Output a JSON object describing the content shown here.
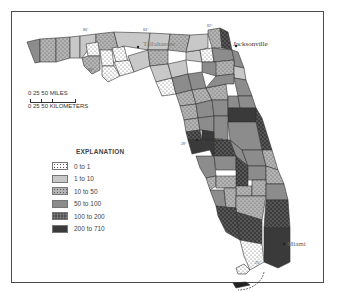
{
  "map": {
    "region": "Florida",
    "cities": [
      {
        "name": "Tallahassee"
      },
      {
        "name": "Jacksonville"
      },
      {
        "name": "Tampa"
      },
      {
        "name": "Miami"
      }
    ],
    "graticule_labels": [
      "86°",
      "84°",
      "82°",
      "30°",
      "28°",
      "26°",
      "25°"
    ]
  },
  "scale": {
    "miles_label": "0    25    50 MILES",
    "km_label": "0  25 50 KILOMETERS"
  },
  "legend": {
    "title": "EXPLANATION",
    "classes": [
      {
        "label": "0 to 1",
        "fill": "#ffffff",
        "pattern": "dots"
      },
      {
        "label": "1 to 10",
        "fill": "#c8c8c8",
        "pattern": "none"
      },
      {
        "label": "10 to 50",
        "fill": "#b4b4b4",
        "pattern": "dots"
      },
      {
        "label": "50 to 100",
        "fill": "#8c8c8c",
        "pattern": "none"
      },
      {
        "label": "100 to 200",
        "fill": "#555555",
        "pattern": "checker"
      },
      {
        "label": "200 to 710",
        "fill": "#3a3a3a",
        "pattern": "none"
      }
    ]
  }
}
